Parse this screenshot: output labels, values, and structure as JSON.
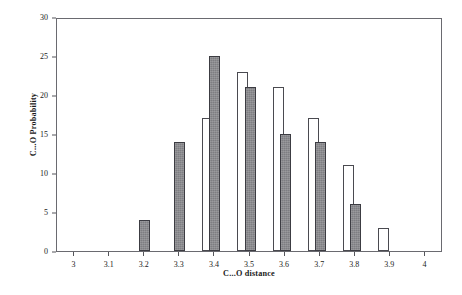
{
  "chart_data": {
    "type": "bar",
    "title": "",
    "subtitle": "",
    "xlabel": "C...O distance",
    "ylabel": "C...O Probability",
    "xlim": [
      2.95,
      4.05
    ],
    "ylim": [
      0,
      30
    ],
    "grid": false,
    "legend": "none",
    "x_ticks": [
      "3",
      "3.1",
      "3.2",
      "3.3",
      "3.4",
      "3.5",
      "3.6",
      "3.7",
      "3.8",
      "3.9",
      "4"
    ],
    "x_tick_values": [
      3,
      3.1,
      3.2,
      3.3,
      3.4,
      3.5,
      3.6,
      3.7,
      3.8,
      3.9,
      4
    ],
    "y_ticks": [
      "0",
      "5",
      "10",
      "15",
      "20",
      "25",
      "30"
    ],
    "y_tick_values": [
      0,
      5,
      10,
      15,
      20,
      25,
      30
    ],
    "series": [
      {
        "name": "open",
        "fill": "#ffffff",
        "edge": "#4a4a50",
        "points": [
          {
            "x": 3.38,
            "value": 17
          },
          {
            "x": 3.48,
            "value": 23
          },
          {
            "x": 3.58,
            "value": 21
          },
          {
            "x": 3.68,
            "value": 17
          },
          {
            "x": 3.78,
            "value": 11
          },
          {
            "x": 3.88,
            "value": 3
          }
        ]
      },
      {
        "name": "filled",
        "fill": "#7e7e82",
        "edge": "#3c3c42",
        "points": [
          {
            "x": 3.2,
            "value": 4
          },
          {
            "x": 3.3,
            "value": 14
          },
          {
            "x": 3.4,
            "value": 25
          },
          {
            "x": 3.5,
            "value": 21
          },
          {
            "x": 3.6,
            "value": 15
          },
          {
            "x": 3.7,
            "value": 14
          },
          {
            "x": 3.8,
            "value": 6
          }
        ]
      }
    ]
  }
}
